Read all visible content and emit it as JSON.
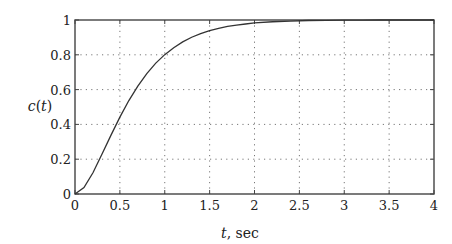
{
  "chart_data": {
    "type": "line",
    "title": "",
    "xlabel": "t, sec",
    "ylabel": "c(t)",
    "xlim": [
      0,
      4
    ],
    "ylim": [
      0,
      1
    ],
    "grid": true,
    "legend": null,
    "xticks": [
      0,
      0.5,
      1,
      1.5,
      2,
      2.5,
      3,
      3.5,
      4
    ],
    "xtick_labels": [
      "0",
      "0.5",
      "1",
      "1.5",
      "2",
      "2.5",
      "3",
      "3.5",
      "4"
    ],
    "yticks": [
      0,
      0.2,
      0.4,
      0.6,
      0.8,
      1
    ],
    "ytick_labels": [
      "0",
      "0.2",
      "0.4",
      "0.6",
      "0.8",
      "1"
    ],
    "series": [
      {
        "name": "c(t)",
        "x": [
          0,
          0.1,
          0.2,
          0.3,
          0.4,
          0.5,
          0.6,
          0.7,
          0.8,
          0.9,
          1.0,
          1.1,
          1.2,
          1.3,
          1.4,
          1.5,
          1.6,
          1.7,
          1.8,
          1.9,
          2.0,
          2.2,
          2.4,
          2.6,
          2.8,
          3.0,
          3.2,
          3.4,
          3.6,
          3.8,
          4.0
        ],
        "values": [
          0,
          0.037,
          0.122,
          0.228,
          0.337,
          0.442,
          0.537,
          0.62,
          0.692,
          0.752,
          0.801,
          0.841,
          0.874,
          0.901,
          0.922,
          0.939,
          0.952,
          0.963,
          0.971,
          0.977,
          0.983,
          0.99,
          0.994,
          0.997,
          0.998,
          0.999,
          0.999,
          1.0,
          1.0,
          1.0,
          1.0
        ]
      }
    ]
  },
  "axes": {
    "xlabel_italic": "t",
    "xlabel_rest": ", sec",
    "ylabel_c": "c",
    "ylabel_paren_open": "(",
    "ylabel_t": "t",
    "ylabel_paren_close": ")"
  }
}
